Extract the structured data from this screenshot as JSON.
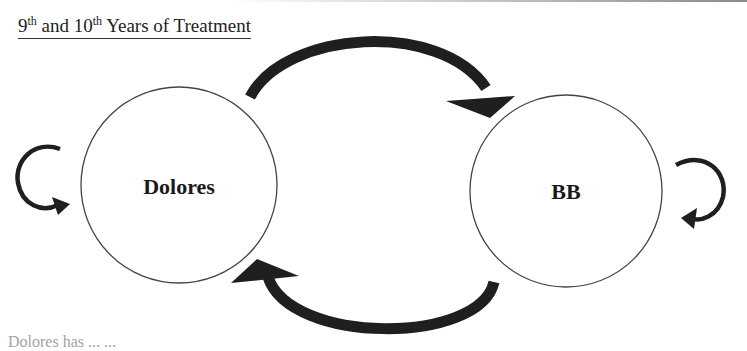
{
  "title": {
    "part1_num": "9",
    "part1_sup": "th",
    "part2": " and 10",
    "part2_sup": "th",
    "part3": " Years of Treatment"
  },
  "nodes": [
    {
      "id": "dolores",
      "label": "Dolores",
      "cx": 179,
      "cy": 185,
      "r": 98
    },
    {
      "id": "bb",
      "label": "BB",
      "cx": 566,
      "cy": 191,
      "r": 96
    }
  ],
  "edges": [
    {
      "from": "dolores",
      "to": "bb",
      "kind": "arc-top"
    },
    {
      "from": "bb",
      "to": "dolores",
      "kind": "arc-bottom"
    },
    {
      "from": "dolores",
      "to": "dolores",
      "kind": "self-loop-left"
    },
    {
      "from": "bb",
      "to": "bb",
      "kind": "self-loop-right"
    }
  ],
  "colors": {
    "arrow": "#1f1f1f",
    "circle_stroke": "#444444",
    "text": "#1a1a1a"
  },
  "footer_partial": "Dolores  has  ...  ..."
}
